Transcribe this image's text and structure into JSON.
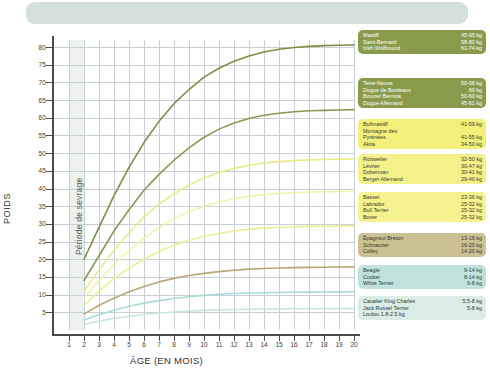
{
  "header": {
    "text": ""
  },
  "chart_data": {
    "type": "line",
    "title": "",
    "xlabel": "ÂGE (EN MOIS)",
    "ylabel": "POIDS",
    "xlim": [
      0,
      20
    ],
    "ylim": [
      0,
      82
    ],
    "grid": true,
    "legend_position": "right",
    "x_ticks": [
      "1",
      "2",
      "3",
      "4",
      "5",
      "6",
      "7",
      "8",
      "9",
      "10",
      "11",
      "12",
      "13",
      "14",
      "15",
      "16",
      "17",
      "18",
      "19",
      "20"
    ],
    "y_ticks": [
      "5",
      "10",
      "15",
      "20",
      "25",
      "30",
      "35",
      "40",
      "45",
      "50",
      "55",
      "60",
      "65",
      "70",
      "75",
      "80"
    ],
    "annotations": [
      {
        "text": "Période de sevrage",
        "x_from": 1,
        "x_to": 2,
        "orientation": "vertical"
      }
    ],
    "x": [
      2,
      3,
      4,
      5,
      6,
      7,
      8,
      9,
      10,
      11,
      12,
      13,
      14,
      15,
      16,
      17,
      18,
      19,
      20
    ],
    "series": [
      {
        "name": "giant",
        "color": "#7f8e45",
        "values": [
          20,
          29,
          38,
          46,
          53,
          59,
          64,
          68,
          71.5,
          74,
          76,
          77.5,
          78.6,
          79.4,
          79.9,
          80.2,
          80.4,
          80.5,
          80.6
        ]
      },
      {
        "name": "very-large",
        "color": "#8b9a52",
        "values": [
          14,
          21,
          28,
          34,
          39.5,
          44,
          48,
          51.5,
          54.5,
          56.8,
          58.5,
          59.8,
          60.7,
          61.3,
          61.7,
          62,
          62.1,
          62.2,
          62.3
        ]
      },
      {
        "name": "large",
        "color": "#e8ec86",
        "values": [
          11,
          17,
          22.5,
          27.5,
          32,
          35.5,
          38.5,
          41,
          43,
          44.5,
          45.7,
          46.6,
          47.2,
          47.6,
          47.9,
          48.1,
          48.2,
          48.3,
          48.4
        ]
      },
      {
        "name": "medium-large",
        "color": "#f2f3a8",
        "values": [
          9,
          14,
          18.5,
          22.5,
          26,
          29,
          31.5,
          33.5,
          35,
          36.2,
          37.1,
          37.8,
          38.3,
          38.6,
          38.8,
          39,
          39.1,
          39.15,
          39.2
        ]
      },
      {
        "name": "medium",
        "color": "#eaef8f",
        "values": [
          7,
          11,
          14.5,
          17.5,
          20,
          22.2,
          24,
          25.4,
          26.5,
          27.3,
          28,
          28.5,
          28.8,
          29,
          29.2,
          29.3,
          29.35,
          29.4,
          29.45
        ]
      },
      {
        "name": "medium-small",
        "color": "#b9a77a",
        "values": [
          4.5,
          7,
          9,
          10.8,
          12.3,
          13.6,
          14.6,
          15.4,
          16,
          16.5,
          16.9,
          17.2,
          17.4,
          17.55,
          17.65,
          17.7,
          17.75,
          17.8,
          17.85
        ]
      },
      {
        "name": "small",
        "color": "#a8ddd6",
        "values": [
          2.8,
          4.3,
          5.6,
          6.7,
          7.6,
          8.3,
          8.9,
          9.4,
          9.8,
          10.1,
          10.3,
          10.45,
          10.55,
          10.62,
          10.68,
          10.72,
          10.75,
          10.77,
          10.8
        ]
      },
      {
        "name": "toy",
        "color": "#c8e6de",
        "values": [
          1.6,
          2.5,
          3.3,
          3.9,
          4.4,
          4.8,
          5.1,
          5.35,
          5.55,
          5.7,
          5.8,
          5.87,
          5.92,
          5.96,
          5.99,
          6.01,
          6.02,
          6.03,
          6.04
        ]
      }
    ]
  },
  "legend": {
    "groups": [
      {
        "id": "giant",
        "bg": "#8a9a4c",
        "fg": "#ffffff",
        "rows": [
          {
            "name": "Mastiff",
            "weight": "45-95 kg"
          },
          {
            "name": "Saint-Bernard",
            "weight": "58-80 kg"
          },
          {
            "name": "Irish Wolfhound",
            "weight": "61-74 kg"
          }
        ]
      },
      {
        "id": "very-large",
        "bg": "#8a9a4c",
        "fg": "#ffffff",
        "rows": [
          {
            "name": "Terre-Neuve",
            "weight": "50-68 kg"
          },
          {
            "name": "Dogue de Bordeaux",
            "weight": "60 kg"
          },
          {
            "name": "Bouvier Bernois",
            "weight": "50-60 kg"
          },
          {
            "name": "Dogue Allemand",
            "weight": "45-61 kg"
          }
        ]
      },
      {
        "id": "large",
        "bg": "#f2ef7a",
        "fg": "#3a3a28",
        "rows": [
          {
            "name": "Bullmastiff",
            "weight": "41-59 kg"
          },
          {
            "name": "Montagne des",
            "weight": ""
          },
          {
            "name": "Pyrénées",
            "weight": "41-55 kg"
          },
          {
            "name": "Akita",
            "weight": "34-50 kg"
          }
        ]
      },
      {
        "id": "medium-large",
        "bg": "#f4f08a",
        "fg": "#3a3a28",
        "rows": [
          {
            "name": "Rottweiler",
            "weight": "32-50 kg"
          },
          {
            "name": "Lévrier",
            "weight": "30-47 kg"
          },
          {
            "name": "Doberman",
            "weight": "30-41 kg"
          },
          {
            "name": "Berger Allemand",
            "weight": "29-40 kg"
          }
        ]
      },
      {
        "id": "medium",
        "bg": "#f6f28f",
        "fg": "#3a3a28",
        "rows": [
          {
            "name": "Basset",
            "weight": "23-36 kg"
          },
          {
            "name": "Labrador",
            "weight": "25-32 kg"
          },
          {
            "name": "Bull Terrier",
            "weight": "25-32 kg"
          },
          {
            "name": "Boxer",
            "weight": "25-32 kg"
          }
        ]
      },
      {
        "id": "medium-small",
        "bg": "#cbc092",
        "fg": "#3a3426",
        "rows": [
          {
            "name": "Épagneul Breton",
            "weight": "13-16 kg"
          },
          {
            "name": "Schnauzer",
            "weight": "16-20 kg"
          },
          {
            "name": "Colley",
            "weight": "14-20 kg"
          }
        ]
      },
      {
        "id": "small",
        "bg": "#bfe3dc",
        "fg": "#2c3a38",
        "rows": [
          {
            "name": "Beagle",
            "weight": "9-14 kg"
          },
          {
            "name": "Cocker",
            "weight": "8-14 kg"
          },
          {
            "name": "White Terrier",
            "weight": "6-8 kg"
          }
        ]
      },
      {
        "id": "toy",
        "bg": "#d9ece6",
        "fg": "#2c3a38",
        "rows": [
          {
            "name": "Cavalier King Charles",
            "weight": "5.5-8 kg"
          },
          {
            "name": "Jack Russel Terrier",
            "weight": "5-8 kg"
          },
          {
            "name": "Loulou 1.8-2.5 kg",
            "weight": ""
          }
        ]
      }
    ]
  }
}
